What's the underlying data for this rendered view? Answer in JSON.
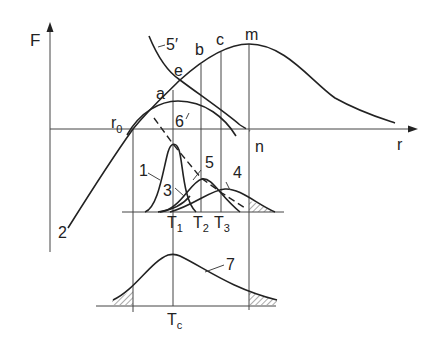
{
  "axes": {
    "y_label": "F",
    "x_label": "r"
  },
  "points": {
    "r0": "r",
    "r0_sub": "0",
    "a": "a",
    "e": "e",
    "b": "b",
    "c": "c",
    "m": "m",
    "n": "n"
  },
  "curve_labels": {
    "c1": "1",
    "c2": "2",
    "c3": "3",
    "c4": "4",
    "c5": "5",
    "c5p": "5′",
    "c6": "6",
    "c7": "7"
  },
  "temperatures": {
    "t1": "T",
    "t1_sub": "1",
    "t2": "T",
    "t2_sub": "2",
    "t3": "T",
    "t3_sub": "3",
    "tc": "T",
    "tc_sub": "c"
  }
}
